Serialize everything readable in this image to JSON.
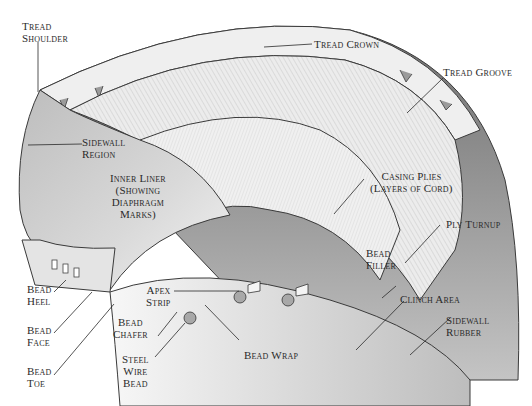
{
  "diagram": {
    "colors": {
      "background": "#ffffff",
      "outline": "#3a3a3a",
      "sidewall_rubber": "#8e8e8e",
      "inner_liner": "#c8c8c8",
      "plies": "#e6e6e6",
      "tread": "#efefef",
      "text": "#2a2a2a"
    },
    "labels": {
      "tread_shoulder": [
        "Tread",
        "Shoulder"
      ],
      "tread_crown": [
        "Tread Crown"
      ],
      "tread_groove": [
        "Tread Groove"
      ],
      "sidewall_region": [
        "Sidewall",
        "Region"
      ],
      "inner_liner": [
        "Inner Liner",
        "(Showing",
        "Diaphragm",
        "Marks)"
      ],
      "casing_plies": [
        "Casing Plies",
        "(Layers of Cord)"
      ],
      "ply_turnup": [
        "Ply Turnup"
      ],
      "bead_filler": [
        "Bead",
        "Filler"
      ],
      "apex_strip": [
        "Apex",
        "Strip"
      ],
      "clinch_area": [
        "Clinch Area"
      ],
      "sidewall_rubber": [
        "Sidewall",
        "Rubber"
      ],
      "bead_heel": [
        "Bead",
        "Heel"
      ],
      "bead_face": [
        "Bead",
        "Face"
      ],
      "bead_toe": [
        "Bead",
        "Toe"
      ],
      "bead_chafer": [
        "Bead",
        "Chafer"
      ],
      "steel_wire_bead": [
        "Steel",
        "Wire",
        "Bead"
      ],
      "bead_wrap": [
        "Bead Wrap"
      ]
    }
  }
}
